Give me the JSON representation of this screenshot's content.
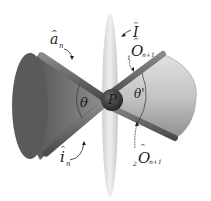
{
  "diagram": {
    "center_point": {
      "label": "P"
    },
    "angles": {
      "left": "θ",
      "right": "θ'"
    },
    "vectors": {
      "a_n": {
        "symbol": "a",
        "subscript": "n",
        "hat": "^"
      },
      "i_n": {
        "symbol": "i",
        "subscript": "n",
        "hat": "^"
      },
      "I": {
        "symbol": "I",
        "hat": "^"
      },
      "O1": {
        "prefix": "1",
        "symbol": "O",
        "subscript": "n+1",
        "hat": "^"
      },
      "O2": {
        "prefix": "2",
        "symbol": "O",
        "subscript": "n+1",
        "hat": "^"
      }
    },
    "colors": {
      "left_cone_dark": "#5e5e5e",
      "left_cone_light": "#8a8a8a",
      "right_cone_dark": "#9a9a9a",
      "right_cone_light": "#d4d4d4",
      "disk": "#dcdcdc",
      "rod": "#6a6a6a",
      "sphere": "#3a3a3a"
    }
  }
}
